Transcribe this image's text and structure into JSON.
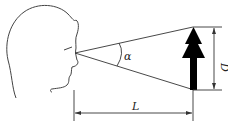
{
  "diagram": {
    "labels": {
      "angle": "α",
      "distance": "L",
      "size": "D"
    },
    "colors": {
      "line": "#333333",
      "arrow": "#000000",
      "background": "#ffffff"
    }
  }
}
